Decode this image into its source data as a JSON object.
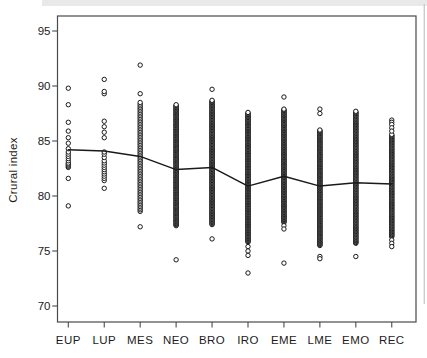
{
  "chart_data": {
    "type": "scatter",
    "subtype": "strip-plot-with-mean-line",
    "title": "",
    "xlabel": "",
    "ylabel": "Crural index",
    "yticks": [
      70,
      75,
      80,
      85,
      90,
      95
    ],
    "ylim": [
      68.5,
      96.4
    ],
    "grid": false,
    "legend": "none",
    "marker": "open-circle",
    "colors": {
      "marker_stroke": "#1a1a1a",
      "mean_line": "#1a1a1a",
      "axis": "#4a4a4a",
      "tick_text": "#1c1c1c"
    },
    "categories": [
      "EUP",
      "LUP",
      "MES",
      "NEO",
      "BRO",
      "IRO",
      "EME",
      "LME",
      "EMO",
      "REC"
    ],
    "mean_line_values": [
      84.2,
      84.1,
      83.6,
      82.4,
      82.6,
      80.9,
      81.8,
      80.9,
      81.2,
      81.1
    ],
    "groups": [
      {
        "label": "EUP",
        "points": [
          79.1,
          81.6,
          82.6,
          82.7,
          82.8,
          82.9,
          83.0,
          83.2,
          83.4,
          83.6,
          83.8,
          84.0,
          84.3,
          84.8,
          85.3,
          85.9,
          86.7,
          88.3,
          89.8
        ]
      },
      {
        "label": "LUP",
        "points": [
          80.7,
          81.4,
          81.6,
          81.8,
          82.0,
          82.2,
          82.4,
          82.6,
          82.8,
          83.0,
          83.2,
          83.5,
          83.8,
          84.0,
          85.3,
          85.8,
          86.3,
          86.8,
          89.3,
          89.5,
          90.6
        ]
      },
      {
        "label": "MES",
        "points": [
          91.9,
          89.3,
          77.2
        ],
        "dense": {
          "min": 78.6,
          "max": 88.5,
          "count": 68
        }
      },
      {
        "label": "NEO",
        "points": [
          74.2
        ],
        "dense": {
          "min": 77.3,
          "max": 88.3,
          "count": 170
        }
      },
      {
        "label": "BRO",
        "points": [
          89.7,
          76.1
        ],
        "dense": {
          "min": 77.4,
          "max": 88.7,
          "count": 170
        }
      },
      {
        "label": "IRO",
        "points": [
          75.4,
          75.0,
          74.6,
          73.0
        ],
        "dense": {
          "min": 75.8,
          "max": 87.6,
          "count": 180
        }
      },
      {
        "label": "EME",
        "points": [
          89.0,
          77.3,
          77.0,
          73.9
        ],
        "dense": {
          "min": 77.6,
          "max": 87.9,
          "count": 160
        }
      },
      {
        "label": "LME",
        "points": [
          87.9,
          87.5,
          74.5,
          74.3
        ],
        "dense": {
          "min": 75.5,
          "max": 86.0,
          "count": 165
        }
      },
      {
        "label": "EMO",
        "points": [
          74.5
        ],
        "dense": {
          "min": 75.7,
          "max": 87.7,
          "count": 180
        }
      },
      {
        "label": "REC",
        "points": [
          86.9,
          86.7,
          86.5,
          86.2,
          85.9,
          76.0,
          75.7,
          75.4
        ],
        "dense": {
          "min": 76.3,
          "max": 85.6,
          "count": 140
        }
      }
    ]
  }
}
